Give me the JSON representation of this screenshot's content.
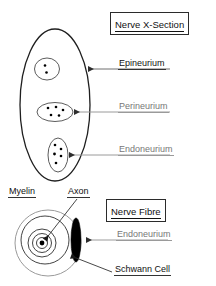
{
  "figure": {
    "kind": "biology-diagram"
  },
  "panels": {
    "top": {
      "title": "Nerve X-Section",
      "labels": {
        "epineurium": "Epineurium",
        "perineurium": "Perineurium",
        "endoneurium": "Endoneurium"
      },
      "fascicles": [
        {
          "name": "fascicle-top",
          "axon_count": 2
        },
        {
          "name": "fascicle-middle",
          "axon_count": 5
        },
        {
          "name": "fascicle-bottom",
          "axon_count": 5
        }
      ]
    },
    "bottom": {
      "title": "Nerve Fibre",
      "labels": {
        "myelin": "Myelin",
        "axon": "Axon",
        "endoneurium": "Endoneurium",
        "schwann_cell": "Schwann Cell"
      },
      "myelin_ring_count": 4
    }
  },
  "colors": {
    "outline_dark": "#1f1f1f",
    "outline_mid": "#4a4a4a",
    "outline_light": "#8c8c8c",
    "arrow_grey": "#8a8a8a",
    "arrow_dark": "#3a3a3a",
    "fill_black": "#000000",
    "background": "#ffffff",
    "text_dark": "#111111",
    "text_grey": "#777777"
  }
}
